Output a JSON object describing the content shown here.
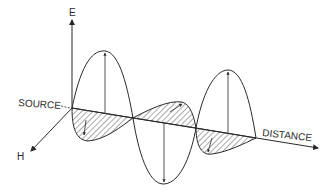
{
  "diagram": {
    "type": "electromagnetic-wave",
    "labels": {
      "e_axis": "E",
      "h_axis": "H",
      "source": "SOURCE",
      "distance": "DISTANCE"
    },
    "colors": {
      "line": "#2a2a2a",
      "background": "#ffffff"
    }
  }
}
